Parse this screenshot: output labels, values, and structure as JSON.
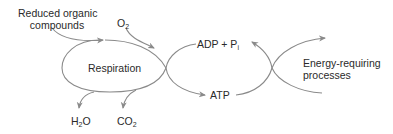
{
  "diagram": {
    "colors": {
      "line": "#8a8a8a",
      "text": "#2a2a2a",
      "background": "#ffffff"
    },
    "nodes": {
      "respiration": {
        "label": "Respiration"
      },
      "energy_processes": {
        "line1": "Energy-requiring",
        "line2": "processes"
      }
    },
    "inputs": {
      "reduced_organic": {
        "line1": "Reduced organic",
        "line2": "compounds"
      },
      "oxygen": {
        "base": "O",
        "sub": "2"
      }
    },
    "outputs": {
      "water": {
        "pre": "H",
        "sub": "2",
        "post": "O"
      },
      "carbon_dioxide": {
        "base": "CO",
        "sub": "2"
      }
    },
    "cycle": {
      "adp": {
        "text": "ADP + P",
        "sub": "i"
      },
      "atp": {
        "text": "ATP"
      }
    }
  }
}
